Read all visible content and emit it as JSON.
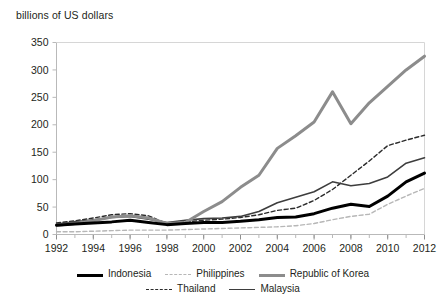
{
  "chart_data": {
    "type": "line",
    "title": "",
    "ylabel": "billions of US dollars",
    "xlabel": "",
    "ylim": [
      0,
      350
    ],
    "ytick_step": 50,
    "yticks": [
      "0",
      "50",
      "100",
      "150",
      "200",
      "250",
      "300",
      "350"
    ],
    "xlim": [
      1992,
      2012
    ],
    "xtick_step": 2,
    "xticks": [
      "1992",
      "1994",
      "1996",
      "1998",
      "2000",
      "2002",
      "2004",
      "2006",
      "2008",
      "2010",
      "2012"
    ],
    "minor_xticks_every_year": true,
    "grid": false,
    "legend_position": "bottom",
    "x": [
      1992,
      1993,
      1994,
      1995,
      1996,
      1997,
      1998,
      1999,
      2000,
      2001,
      2002,
      2003,
      2004,
      2005,
      2006,
      2007,
      2008,
      2009,
      2010,
      2011,
      2012
    ],
    "series": [
      {
        "name": "Indonesia",
        "style": "solid",
        "width": 3,
        "color": "#000000",
        "values": [
          17,
          19,
          21,
          23,
          26,
          22,
          18,
          20,
          22,
          22,
          24,
          27,
          31,
          32,
          38,
          48,
          55,
          51,
          70,
          96,
          112
        ]
      },
      {
        "name": "Philippines",
        "style": "dashed",
        "width": 1.4,
        "color": "#b7b7b7",
        "values": [
          5,
          5,
          6,
          7,
          8,
          8,
          8,
          9,
          10,
          11,
          12,
          13,
          14,
          16,
          20,
          27,
          33,
          37,
          55,
          70,
          84
        ]
      },
      {
        "name": "Republic of Korea",
        "style": "solid",
        "width": 3,
        "color": "#8c8c8c",
        "values": [
          17,
          20,
          25,
          32,
          34,
          30,
          20,
          22,
          42,
          60,
          86,
          108,
          157,
          180,
          205,
          260,
          202,
          240,
          270,
          300,
          325
        ]
      },
      {
        "name": "Thailand",
        "style": "dashed",
        "width": 1.4,
        "color": "#2b2b2b",
        "values": [
          21,
          25,
          30,
          36,
          38,
          34,
          20,
          23,
          26,
          28,
          31,
          36,
          44,
          48,
          62,
          82,
          108,
          134,
          162,
          172,
          181
        ]
      },
      {
        "name": "Malaysia",
        "style": "solid",
        "width": 1.6,
        "color": "#3d3d3d",
        "values": [
          19,
          23,
          27,
          31,
          33,
          28,
          22,
          26,
          29,
          30,
          33,
          42,
          58,
          68,
          78,
          96,
          89,
          93,
          105,
          130,
          140
        ]
      }
    ]
  },
  "legend": {
    "rows": [
      [
        {
          "label": "Indonesia",
          "key": "indonesia"
        },
        {
          "label": "Philippines",
          "key": "philippines"
        },
        {
          "label": "Republic of Korea",
          "key": "korea"
        }
      ],
      [
        {
          "label": "Thailand",
          "key": "thailand"
        },
        {
          "label": "Malaysia",
          "key": "malaysia"
        }
      ]
    ]
  }
}
